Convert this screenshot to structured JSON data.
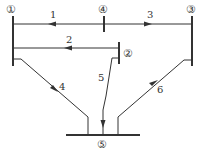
{
  "diagram": {
    "type": "power-network",
    "nodes": [
      {
        "id": "1",
        "label": "①"
      },
      {
        "id": "2",
        "label": "②"
      },
      {
        "id": "3",
        "label": "③"
      },
      {
        "id": "4",
        "label": "④"
      },
      {
        "id": "5",
        "label": "⑤"
      }
    ],
    "branches": [
      {
        "id": "1",
        "label": "1",
        "from": "4",
        "to": "1"
      },
      {
        "id": "2",
        "label": "2",
        "from": "2",
        "to": "1"
      },
      {
        "id": "3",
        "label": "3",
        "from": "4",
        "to": "3"
      },
      {
        "id": "4",
        "label": "4",
        "from": "1",
        "to": "5"
      },
      {
        "id": "5",
        "label": "5",
        "from": "2",
        "to": "5"
      },
      {
        "id": "6",
        "label": "6",
        "from": "5",
        "to": "3"
      }
    ],
    "colors": {
      "line": "#333333",
      "background": "#ffffff"
    }
  }
}
